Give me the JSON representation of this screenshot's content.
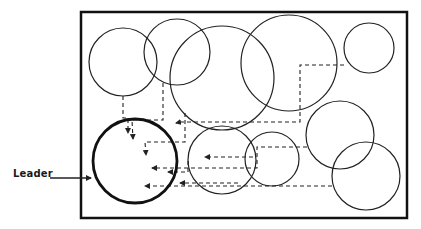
{
  "diagram": {
    "label": "Leader",
    "colors": {
      "stroke": "#222222",
      "background": "#ffffff"
    },
    "frame": {
      "x": 81,
      "y": 12,
      "width": 326,
      "height": 206
    },
    "leader": {
      "cx": 135,
      "cy": 161,
      "r": 42
    },
    "circles": [
      {
        "id": "c1",
        "cx": 123,
        "cy": 62,
        "r": 34
      },
      {
        "id": "c2",
        "cx": 177,
        "cy": 52,
        "r": 33
      },
      {
        "id": "c3",
        "cx": 222,
        "cy": 78,
        "r": 52
      },
      {
        "id": "c4",
        "cx": 289,
        "cy": 63,
        "r": 48
      },
      {
        "id": "c5",
        "cx": 369,
        "cy": 48,
        "r": 25
      },
      {
        "id": "c6",
        "cx": 222,
        "cy": 160,
        "r": 34
      },
      {
        "id": "c7",
        "cx": 272,
        "cy": 159,
        "r": 27
      },
      {
        "id": "c8",
        "cx": 340,
        "cy": 135,
        "r": 34
      },
      {
        "id": "c9",
        "cx": 366,
        "cy": 176,
        "r": 34
      }
    ],
    "arrows": [
      {
        "from": "c1",
        "points": "123,96 123,118 128,118 128,133"
      },
      {
        "from": "c2",
        "points": "163,83 163,120 132,120 133,139"
      },
      {
        "from": "c3",
        "points": "185,113 185,142 145,142 146,155"
      },
      {
        "from": "c5",
        "points": "344,65 300,65 300,122 181,122 176,123"
      },
      {
        "from": "c7",
        "points": "253,157 205,157"
      },
      {
        "from": "c6",
        "points": "188,161 188,172 168,172"
      },
      {
        "from": "c8",
        "points": "307,147 257,147 257,168 152,168"
      },
      {
        "from": "c9",
        "points": "332,186 145,186"
      },
      {
        "from": "c7b",
        "points": "238,183 180,183"
      }
    ]
  }
}
